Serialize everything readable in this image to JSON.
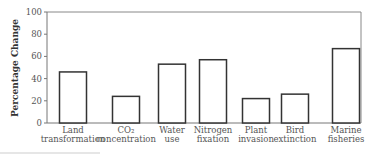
{
  "chart_data": {
    "type": "bar",
    "title": "",
    "xlabel": "",
    "ylabel": "Percentage Change",
    "ylim": [
      0,
      100
    ],
    "yticks": [
      0,
      20,
      40,
      60,
      80,
      100
    ],
    "grid": false,
    "legend": null,
    "categories": [
      [
        "Land",
        "transformation"
      ],
      [
        "CO₂",
        "concentration"
      ],
      [
        "Water",
        "use"
      ],
      [
        "Nitrogen",
        "fixation"
      ],
      [
        "Plant",
        "invasion"
      ],
      [
        "Bird",
        "extinction"
      ],
      [
        "Marine",
        "fisheries"
      ]
    ],
    "category_names": [
      "Land transformation",
      "CO2 concentration",
      "Water use",
      "Nitrogen fixation",
      "Plant invasion",
      "Bird extinction",
      "Marine fisheries"
    ],
    "values": [
      46,
      24,
      53,
      57,
      22,
      26,
      67
    ],
    "colors": {
      "bar_fill": "#ffffff",
      "bar_stroke": "#333333",
      "axis": "#777777"
    }
  }
}
